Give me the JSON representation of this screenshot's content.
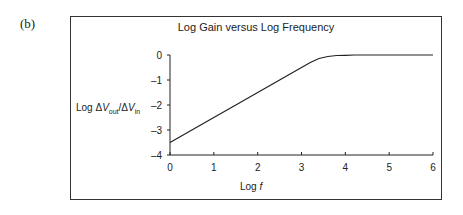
{
  "panel_label": "(b)",
  "chart_data": {
    "type": "line",
    "title": "Log Gain versus Log Frequency",
    "xlabel": "Log f",
    "ylabel": "Log ΔVout/ΔVin",
    "xlim": [
      0,
      6
    ],
    "ylim": [
      -4,
      0
    ],
    "x_ticks": [
      0,
      1,
      2,
      3,
      4,
      5,
      6
    ],
    "y_ticks": [
      0,
      -1,
      -2,
      -3,
      -4
    ],
    "grid": false,
    "legend": null,
    "series": [
      {
        "name": "Log gain",
        "x": [
          0,
          0.5,
          1,
          1.5,
          2,
          2.5,
          3,
          3.2,
          3.4,
          3.6,
          3.8,
          4.0,
          4.2,
          5,
          6
        ],
        "y": [
          -3.5,
          -3.0,
          -2.5,
          -2.0,
          -1.5,
          -1.0,
          -0.5,
          -0.3,
          -0.14,
          -0.06,
          -0.02,
          -0.01,
          0,
          0,
          0
        ]
      }
    ],
    "color": "#222222"
  },
  "labels": {
    "title": "Log Gain versus Log Frequency",
    "ylabel_prefix": "Log Δ",
    "ylabel_v1": "V",
    "ylabel_sub1": "out",
    "ylabel_slash": "/Δ",
    "ylabel_v2": "V",
    "ylabel_sub2": "in",
    "xlabel_prefix": "Log ",
    "xlabel_var": "f"
  }
}
